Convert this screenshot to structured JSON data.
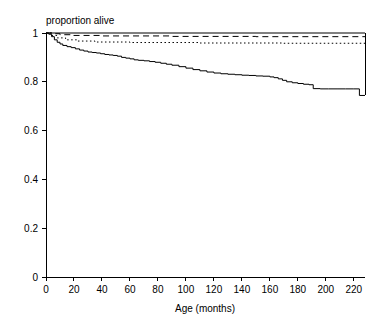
{
  "chart_data": {
    "type": "line",
    "title": "proportion alive",
    "subtitle": "",
    "xlabel": "Age (months)",
    "ylabel": "",
    "xlim": [
      0,
      228
    ],
    "ylim": [
      0,
      1
    ],
    "grid": false,
    "legend_position": "none",
    "xticks": [
      0,
      20,
      40,
      60,
      80,
      100,
      120,
      140,
      160,
      180,
      200,
      220
    ],
    "xtick_labels": [
      "0",
      "20",
      "40",
      "60",
      "80",
      "100",
      "120",
      "140",
      "160",
      "180",
      "200",
      "220"
    ],
    "yticks": [
      0,
      0.2,
      0.4,
      0.6,
      0.8,
      1
    ],
    "ytick_labels": [
      "0",
      "0.2",
      "0.4",
      "0.6",
      "0.8",
      "1"
    ],
    "axis_color": "#000000",
    "series": [
      {
        "name": "group-1-solid-top",
        "style": "solid",
        "color": "#000000",
        "step": true,
        "x": [
          0,
          228
        ],
        "values": [
          1.0,
          1.0
        ]
      },
      {
        "name": "group-2-dashed",
        "style": "dashed",
        "color": "#000000",
        "step": true,
        "x": [
          0,
          5,
          10,
          18,
          40,
          90,
          150,
          228
        ],
        "values": [
          1.0,
          0.997,
          0.993,
          0.99,
          0.988,
          0.986,
          0.985,
          0.985
        ]
      },
      {
        "name": "group-3-dotted",
        "style": "dotted",
        "color": "#000000",
        "step": true,
        "x": [
          0,
          4,
          8,
          14,
          22,
          35,
          60,
          110,
          170,
          228
        ],
        "values": [
          1.0,
          0.99,
          0.98,
          0.972,
          0.967,
          0.963,
          0.961,
          0.959,
          0.958,
          0.957
        ]
      },
      {
        "name": "group-4-solid-lower",
        "style": "solid",
        "color": "#000000",
        "step": true,
        "x": [
          0,
          2,
          4,
          6,
          8,
          10,
          12,
          15,
          18,
          21,
          24,
          27,
          30,
          33,
          36,
          39,
          42,
          45,
          48,
          51,
          54,
          57,
          60,
          63,
          66,
          70,
          74,
          78,
          82,
          86,
          90,
          95,
          100,
          105,
          110,
          115,
          120,
          125,
          130,
          135,
          140,
          145,
          150,
          155,
          160,
          163,
          166,
          169,
          172,
          176,
          180,
          184,
          188,
          191,
          196,
          202,
          208,
          214,
          220,
          224,
          228
        ],
        "values": [
          1.0,
          0.995,
          0.985,
          0.972,
          0.962,
          0.955,
          0.949,
          0.944,
          0.94,
          0.935,
          0.93,
          0.926,
          0.922,
          0.92,
          0.918,
          0.915,
          0.912,
          0.91,
          0.908,
          0.905,
          0.9,
          0.897,
          0.894,
          0.89,
          0.888,
          0.886,
          0.883,
          0.88,
          0.876,
          0.872,
          0.868,
          0.862,
          0.856,
          0.85,
          0.845,
          0.84,
          0.836,
          0.833,
          0.831,
          0.829,
          0.827,
          0.826,
          0.824,
          0.823,
          0.82,
          0.817,
          0.812,
          0.806,
          0.8,
          0.796,
          0.793,
          0.79,
          0.788,
          0.772,
          0.771,
          0.771,
          0.771,
          0.771,
          0.771,
          0.744,
          0.744
        ]
      }
    ]
  },
  "plot_geometry": {
    "left": 46,
    "right": 365,
    "top": 33,
    "bottom": 277
  }
}
